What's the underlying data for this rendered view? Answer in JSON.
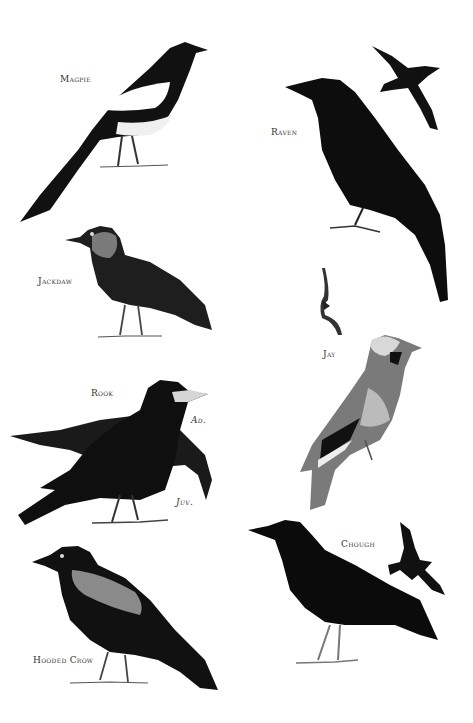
{
  "plate": {
    "background": "#ffffff",
    "ink": "#111111",
    "grey": "#8a8a8a",
    "labels": {
      "magpie": "Magpie",
      "raven": "Raven",
      "jackdaw": "Jackdaw",
      "jay": "Jay",
      "rook": "Rook",
      "rook_adult": "Ad.",
      "rook_juvenile": "Juv.",
      "chough": "Chough",
      "hooded_crow": "Hooded Crow"
    }
  }
}
